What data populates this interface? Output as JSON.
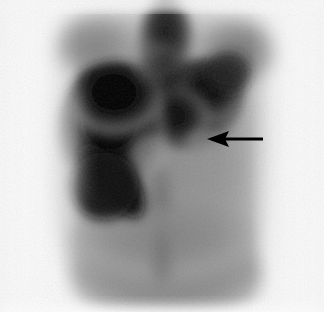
{
  "image": {
    "modality": "nuclear-medicine-scintigram",
    "view": "anterior-torso",
    "width": 324,
    "height": 326,
    "background_color": "#fbfbfb",
    "film_margin_color": "#ffffff"
  },
  "tones": {
    "film_white": "#fbfbfb",
    "body_edge_light": "#cfcfcf",
    "soft_tissue_mid": "#9a9a9a",
    "soft_tissue_dark": "#7a7a7a",
    "organ_dark": "#2c2c2c",
    "organ_black": "#0b0b0b",
    "pure_black": "#000000"
  },
  "anatomy": [
    {
      "name": "body-silhouette",
      "label": "Torso soft tissue outline",
      "tone": "#9a9a9a",
      "region": "x 48-282, y 12-312"
    },
    {
      "name": "liver-uptake",
      "label": "Large intense uptake, right upper quadrant (viewer left)",
      "tone": "#0b0b0b",
      "region": "x 60-165, y 68-228"
    },
    {
      "name": "spleen-uptake",
      "label": "Intense uptake, left upper quadrant (viewer right)",
      "tone": "#121212",
      "region": "x 150-238, y 62-152"
    },
    {
      "name": "spine-mediastinum-band",
      "label": "Vertical midline activity band",
      "tone": "#3a3a3a",
      "region": "x 140-185, y 12-300"
    },
    {
      "name": "pelvic-soft-tissue",
      "label": "Lower abdominal / pelvic background activity",
      "tone": "#8d8d8d",
      "region": "x 70-270, y 230-312"
    }
  ],
  "annotations": [
    {
      "name": "lesion-arrow",
      "type": "arrow",
      "direction": "left",
      "color": "#000000",
      "tip_x": 207,
      "tip_y": 139,
      "tail_x": 263,
      "tail_y": 139,
      "head_length": 22,
      "head_half_height": 8,
      "shaft_thickness": 3,
      "points_at": "spleen-uptake inferior margin defect"
    }
  ]
}
